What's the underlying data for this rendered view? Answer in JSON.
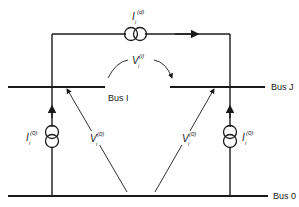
{
  "diagram": {
    "buses": [
      {
        "id": "bus_i",
        "label": "Bus I"
      },
      {
        "id": "bus_j",
        "label": "Bus J"
      },
      {
        "id": "bus_0",
        "label": "Bus 0"
      }
    ],
    "sources": {
      "top": {
        "symbol": "I",
        "sub": "i",
        "sup": "(d)"
      },
      "left": {
        "symbol": "I",
        "sub": "i",
        "sup": "(0)"
      },
      "right": {
        "symbol": "I",
        "sub": "i",
        "sup": "(0)"
      }
    },
    "voltages": {
      "across": {
        "symbol": "V",
        "sub": "i",
        "sup": "(i)"
      },
      "left": {
        "symbol": "V",
        "sub": "i",
        "sup": "(0)"
      },
      "right": {
        "symbol": "V",
        "sub": "i",
        "sup": "(0)"
      }
    },
    "colors": {
      "line": "#1a1a1a",
      "text": "#222222",
      "background": "#ffffff"
    }
  }
}
